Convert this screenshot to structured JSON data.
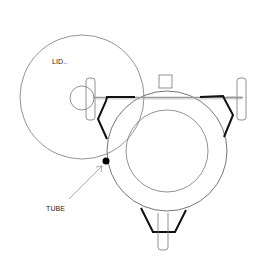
{
  "diagram": {
    "type": "mechanical-top-view",
    "labels": {
      "lid": "LID..",
      "tube": "TUBE"
    },
    "colors": {
      "background": "#ffffff",
      "outline": "#777777",
      "bracket": "#111111",
      "rod": "#999999",
      "tube_dot": "#000000"
    },
    "components": [
      {
        "name": "lid",
        "shape": "circle",
        "cx": 82,
        "cy": 97,
        "r": 62
      },
      {
        "name": "lid-hub",
        "shape": "circle",
        "cx": 82,
        "cy": 98,
        "r": 12
      },
      {
        "name": "left-handle",
        "shape": "rounded-rect",
        "x": 86,
        "y": 78,
        "w": 9,
        "h": 42
      },
      {
        "name": "right-handle",
        "shape": "rounded-rect",
        "x": 237,
        "y": 78,
        "w": 9,
        "h": 42
      },
      {
        "name": "top-block",
        "shape": "rect",
        "x": 159,
        "y": 75,
        "w": 13,
        "h": 13
      },
      {
        "name": "body-outer",
        "shape": "circle",
        "cx": 167,
        "cy": 151,
        "r": 60
      },
      {
        "name": "body-inner",
        "shape": "circle",
        "cx": 167,
        "cy": 151,
        "r": 41
      },
      {
        "name": "bottom-stem",
        "shape": "rounded-rect",
        "x": 158,
        "y": 213,
        "w": 10,
        "h": 37
      },
      {
        "name": "tube",
        "shape": "dot",
        "cx": 106,
        "cy": 161,
        "r": 3.5
      }
    ]
  }
}
